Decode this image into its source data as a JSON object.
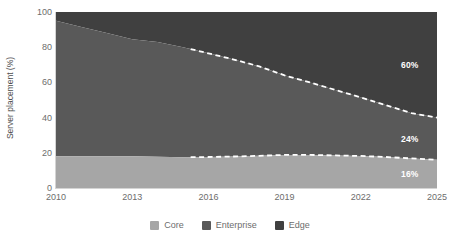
{
  "chart_data": {
    "type": "area",
    "title": "",
    "subtitle": "",
    "xlabel": "",
    "ylabel": "Server placement (%)",
    "xlim": [
      2010,
      2025
    ],
    "ylim": [
      0,
      100
    ],
    "grid": false,
    "stacked": true,
    "stack_total": 100,
    "legend_position": "bottom",
    "x": [
      2010,
      2011,
      2012,
      2013,
      2014,
      2015,
      2016,
      2017,
      2018,
      2019,
      2020,
      2021,
      2022,
      2023,
      2024,
      2025
    ],
    "xticks": [
      2010,
      2013,
      2016,
      2019,
      2022,
      2025
    ],
    "yticks": [
      0,
      20,
      40,
      60,
      80,
      100
    ],
    "forecast_start_x": 2015.3,
    "series": [
      {
        "name": "Core",
        "color": "#a6a6a6",
        "order": "bottom",
        "values": [
          18,
          18,
          18,
          18,
          17.8,
          17.5,
          17.6,
          17.9,
          18.3,
          18.8,
          18.8,
          18.5,
          18.2,
          17.6,
          16.8,
          16
        ]
      },
      {
        "name": "Enterprise",
        "color": "#595959",
        "order": "middle",
        "values": [
          77,
          73.5,
          70,
          66.5,
          65.2,
          62.5,
          58.9,
          55.1,
          50.8,
          45.2,
          41.2,
          37.2,
          33.3,
          29.4,
          25.7,
          24
        ]
      },
      {
        "name": "Edge",
        "color": "#404040",
        "order": "top",
        "values": [
          5,
          8.5,
          12,
          15.5,
          17,
          20,
          23.5,
          27,
          30.9,
          36,
          40,
          44.3,
          48.5,
          53,
          57.5,
          60
        ]
      }
    ],
    "cumulative_boundaries": {
      "core_top": [
        18,
        18,
        18,
        18,
        17.8,
        17.5,
        17.6,
        17.9,
        18.3,
        18.8,
        18.8,
        18.5,
        18.2,
        17.6,
        16.8,
        16
      ],
      "enterprise_top": [
        95,
        91.5,
        88,
        84.5,
        83,
        80,
        76.5,
        73,
        69.1,
        64,
        60,
        55.7,
        51.5,
        47,
        42.5,
        40
      ]
    },
    "annotations": [
      {
        "label": "60%",
        "series": "Edge",
        "x": 2025,
        "y": 70
      },
      {
        "label": "24%",
        "series": "Enterprise",
        "x": 2025,
        "y": 28
      },
      {
        "label": "16%",
        "series": "Core",
        "x": 2025,
        "y": 8
      }
    ],
    "legend": [
      {
        "label": "Core",
        "color": "#a6a6a6"
      },
      {
        "label": "Enterprise",
        "color": "#595959"
      },
      {
        "label": "Edge",
        "color": "#404040"
      }
    ],
    "forecast_line": {
      "style": "dashed",
      "color": "#ffffff"
    }
  },
  "axes": {
    "y_title": "Server placement (%)",
    "y_ticks": [
      "0",
      "20",
      "40",
      "60",
      "80",
      "100"
    ],
    "x_ticks": [
      "2010",
      "2013",
      "2016",
      "2019",
      "2022",
      "2025"
    ]
  },
  "labels": {
    "edge_value": "60%",
    "enterprise_value": "24%",
    "core_value": "16%"
  },
  "legend": {
    "items": [
      {
        "label": "Core"
      },
      {
        "label": "Enterprise"
      },
      {
        "label": "Edge"
      }
    ]
  },
  "colors": {
    "core": "#a6a6a6",
    "enterprise": "#595959",
    "edge": "#404040",
    "axis": "#d4d4d4",
    "tick_text": "#6d6d6d",
    "title_text": "#4f4f4f",
    "forecast": "#ffffff",
    "background": "#ffffff"
  }
}
